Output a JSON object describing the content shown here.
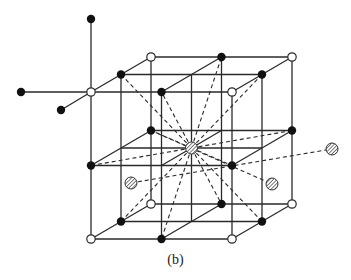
{
  "figure": {
    "caption": "(b)"
  },
  "style": {
    "line_color": "#2a2a2a",
    "open_atom_fill": "#ffffff",
    "dark_atom_fill": "#111111",
    "hatched_atom_stroke": "#333333",
    "background": "#ffffff"
  },
  "geometry": {
    "origin": [
      91,
      239
    ],
    "a": [
      70.5,
      0
    ],
    "b": [
      0,
      -73.5
    ],
    "c": [
      30,
      -17.5
    ]
  },
  "axes_atoms": [
    {
      "type": "dark",
      "pos": [
        91,
        19
      ]
    },
    {
      "type": "dark",
      "pos": [
        21,
        92
      ]
    },
    {
      "type": "dark",
      "pos": [
        61,
        110
      ]
    }
  ],
  "external_hatched_atoms": [
    {
      "pos": [
        131,
        183
      ]
    },
    {
      "pos": [
        272,
        184
      ]
    },
    {
      "pos": [
        332,
        149
      ]
    }
  ],
  "extra_dashed_lines": [
    {
      "from": [
        131,
        183
      ],
      "to": [
        332,
        149
      ]
    },
    {
      "from": [
        151,
        130.5
      ],
      "to": [
        272,
        184
      ]
    }
  ]
}
